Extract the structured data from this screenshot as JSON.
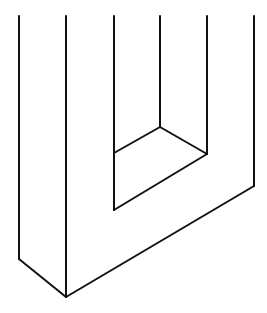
{
  "figure": {
    "stroke_color": "#111111",
    "background": "#ffffff",
    "lines": [
      {
        "name": "outer-left-edge",
        "x1": 19,
        "y1": 16,
        "x2": 19,
        "y2": 259
      },
      {
        "name": "front-corner-edge",
        "x1": 66,
        "y1": 16,
        "x2": 66,
        "y2": 297
      },
      {
        "name": "inner-left-edge",
        "x1": 114,
        "y1": 16,
        "x2": 114,
        "y2": 210
      },
      {
        "name": "inner-back-edge",
        "x1": 160,
        "y1": 16,
        "x2": 160,
        "y2": 127
      },
      {
        "name": "inner-right-edge",
        "x1": 207,
        "y1": 16,
        "x2": 207,
        "y2": 154
      },
      {
        "name": "outer-right-edge",
        "x1": 254,
        "y1": 16,
        "x2": 254,
        "y2": 186
      },
      {
        "name": "bottom-left-diagonal",
        "x1": 19,
        "y1": 259,
        "x2": 66,
        "y2": 297
      },
      {
        "name": "bottom-right-diagonal",
        "x1": 66,
        "y1": 297,
        "x2": 254,
        "y2": 186
      },
      {
        "name": "inner-top-left-diagonal",
        "x1": 114,
        "y1": 153,
        "x2": 160,
        "y2": 127
      },
      {
        "name": "inner-top-right-diagonal",
        "x1": 160,
        "y1": 127,
        "x2": 207,
        "y2": 154
      },
      {
        "name": "inner-bottom-diagonal",
        "x1": 114,
        "y1": 210,
        "x2": 207,
        "y2": 154
      }
    ]
  }
}
